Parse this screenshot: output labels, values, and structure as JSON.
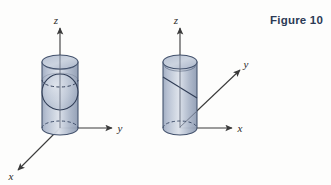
{
  "figure": {
    "caption": "Figure 10",
    "caption_color": "#2c3a55",
    "background_color": "#fdfdfc"
  },
  "palette": {
    "cylinder_fill_light": "#c7cfdd",
    "cylinder_fill_mid": "#aab6c9",
    "cylinder_fill_dark": "#8f9cb2",
    "cylinder_stroke": "#41506b",
    "cap_fill": "#b9c3d4",
    "axis_stroke": "#3a3a3a",
    "hidden_stroke": "#41506b"
  },
  "panels": [
    {
      "id": "left-panel",
      "name": "cylinder-with-sphere",
      "axes": [
        {
          "name": "z-axis",
          "label": "z",
          "direction": "up"
        },
        {
          "name": "y-axis",
          "label": "y",
          "direction": "right"
        },
        {
          "name": "x-axis",
          "label": "x",
          "direction": "lower-left"
        }
      ],
      "solids": [
        {
          "name": "cylinder",
          "label": "cylinder"
        },
        {
          "name": "sphere",
          "label": "sphere"
        }
      ]
    },
    {
      "id": "right-panel",
      "name": "cylinder-with-slanted-plane",
      "axes": [
        {
          "name": "z-axis",
          "label": "z",
          "direction": "up"
        },
        {
          "name": "y-axis",
          "label": "y",
          "direction": "upper-right"
        },
        {
          "name": "x-axis",
          "label": "x",
          "direction": "right"
        }
      ],
      "solids": [
        {
          "name": "cylinder",
          "label": "cylinder"
        },
        {
          "name": "slant-plane",
          "label": "slanted cut"
        }
      ]
    }
  ],
  "labels": {
    "left_z": "z",
    "left_y": "y",
    "left_x": "x",
    "right_z": "z",
    "right_y": "y",
    "right_x": "x"
  }
}
